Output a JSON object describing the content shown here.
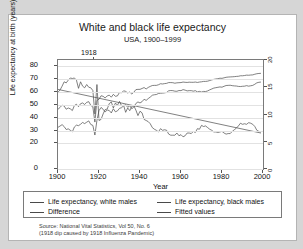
{
  "chart_data": {
    "type": "line",
    "title": "White and black life expectancy",
    "subtitle": "USA, 1900–1999",
    "xlabel": "Year",
    "ylabel": "Life expectancy at birth (years)",
    "xlim": [
      1900,
      2000
    ],
    "ylim": [
      0,
      85
    ],
    "xticks": [
      "1900",
      "1920",
      "1940",
      "1960",
      "1980",
      "2000"
    ],
    "yticks": [
      "0",
      "20",
      "30",
      "40",
      "50",
      "60",
      "70",
      "80"
    ],
    "right_axis_ticks": [
      "0",
      "5",
      "10",
      "15",
      "20"
    ],
    "right_axis_lim": [
      0,
      20
    ],
    "grid": "horizontal",
    "legend_position": "below-plot",
    "annotation": "1918",
    "annotation_x": 1918,
    "series": [
      {
        "name": "Life expectancy, white males",
        "axis": "left",
        "values": [
          [
            1900,
            46.6
          ],
          [
            1901,
            48.0
          ],
          [
            1902,
            49.8
          ],
          [
            1903,
            49.1
          ],
          [
            1904,
            46.6
          ],
          [
            1905,
            47.6
          ],
          [
            1906,
            46.9
          ],
          [
            1907,
            45.6
          ],
          [
            1908,
            49.5
          ],
          [
            1909,
            50.5
          ],
          [
            1910,
            48.6
          ],
          [
            1911,
            50.9
          ],
          [
            1912,
            51.5
          ],
          [
            1913,
            50.3
          ],
          [
            1914,
            52.0
          ],
          [
            1915,
            52.5
          ],
          [
            1916,
            49.6
          ],
          [
            1917,
            48.4
          ],
          [
            1918,
            36.6
          ],
          [
            1919,
            53.5
          ],
          [
            1920,
            54.4
          ],
          [
            1921,
            57.1
          ],
          [
            1922,
            56.7
          ],
          [
            1923,
            55.4
          ],
          [
            1924,
            57.0
          ],
          [
            1925,
            57.6
          ],
          [
            1926,
            56.0
          ],
          [
            1927,
            58.2
          ],
          [
            1928,
            56.7
          ],
          [
            1929,
            57.0
          ],
          [
            1930,
            59.7
          ],
          [
            1931,
            59.4
          ],
          [
            1932,
            61.0
          ],
          [
            1933,
            60.5
          ],
          [
            1934,
            59.3
          ],
          [
            1935,
            60.0
          ],
          [
            1936,
            58.5
          ],
          [
            1937,
            59.9
          ],
          [
            1938,
            61.9
          ],
          [
            1939,
            62.1
          ],
          [
            1940,
            62.1
          ],
          [
            1941,
            62.8
          ],
          [
            1942,
            63.5
          ],
          [
            1943,
            62.4
          ],
          [
            1944,
            63.6
          ],
          [
            1945,
            64.4
          ],
          [
            1946,
            65.1
          ],
          [
            1947,
            65.2
          ],
          [
            1948,
            65.2
          ],
          [
            1949,
            65.7
          ],
          [
            1950,
            66.5
          ],
          [
            1951,
            66.3
          ],
          [
            1952,
            66.6
          ],
          [
            1953,
            66.8
          ],
          [
            1954,
            67.4
          ],
          [
            1955,
            67.4
          ],
          [
            1956,
            67.3
          ],
          [
            1957,
            66.9
          ],
          [
            1958,
            67.2
          ],
          [
            1959,
            67.3
          ],
          [
            1960,
            67.4
          ],
          [
            1961,
            67.8
          ],
          [
            1962,
            67.6
          ],
          [
            1963,
            67.5
          ],
          [
            1964,
            67.7
          ],
          [
            1965,
            67.6
          ],
          [
            1966,
            67.6
          ],
          [
            1967,
            67.8
          ],
          [
            1968,
            67.5
          ],
          [
            1969,
            67.8
          ],
          [
            1970,
            68.0
          ],
          [
            1971,
            68.3
          ],
          [
            1972,
            68.3
          ],
          [
            1973,
            68.5
          ],
          [
            1974,
            69.0
          ],
          [
            1975,
            69.5
          ],
          [
            1976,
            69.9
          ],
          [
            1977,
            70.2
          ],
          [
            1978,
            70.4
          ],
          [
            1979,
            70.8
          ],
          [
            1980,
            70.7
          ],
          [
            1981,
            71.1
          ],
          [
            1982,
            71.5
          ],
          [
            1983,
            71.7
          ],
          [
            1984,
            71.8
          ],
          [
            1985,
            71.9
          ],
          [
            1986,
            72.0
          ],
          [
            1987,
            72.2
          ],
          [
            1988,
            72.3
          ],
          [
            1989,
            72.7
          ],
          [
            1990,
            72.7
          ],
          [
            1991,
            72.9
          ],
          [
            1992,
            73.2
          ],
          [
            1993,
            73.1
          ],
          [
            1994,
            73.3
          ],
          [
            1995,
            73.4
          ],
          [
            1996,
            73.9
          ],
          [
            1997,
            74.3
          ],
          [
            1998,
            74.5
          ],
          [
            1999,
            74.6
          ]
        ]
      },
      {
        "name": "Life expectancy, black males",
        "axis": "left",
        "values": [
          [
            1900,
            32.5
          ],
          [
            1901,
            33.5
          ],
          [
            1902,
            34.6
          ],
          [
            1903,
            33.1
          ],
          [
            1904,
            30.8
          ],
          [
            1905,
            31.3
          ],
          [
            1906,
            30.2
          ],
          [
            1907,
            29.0
          ],
          [
            1908,
            32.8
          ],
          [
            1909,
            34.2
          ],
          [
            1910,
            33.8
          ],
          [
            1911,
            34.9
          ],
          [
            1912,
            36.3
          ],
          [
            1913,
            35.4
          ],
          [
            1914,
            36.5
          ],
          [
            1915,
            37.5
          ],
          [
            1916,
            34.7
          ],
          [
            1917,
            34.0
          ],
          [
            1918,
            26.5
          ],
          [
            1919,
            38.0
          ],
          [
            1920,
            45.5
          ],
          [
            1921,
            48.0
          ],
          [
            1922,
            46.6
          ],
          [
            1923,
            44.5
          ],
          [
            1924,
            46.0
          ],
          [
            1925,
            45.6
          ],
          [
            1926,
            43.7
          ],
          [
            1927,
            47.0
          ],
          [
            1928,
            44.6
          ],
          [
            1929,
            45.3
          ],
          [
            1930,
            47.3
          ],
          [
            1931,
            47.8
          ],
          [
            1932,
            49.3
          ],
          [
            1933,
            50.1
          ],
          [
            1934,
            48.1
          ],
          [
            1935,
            49.3
          ],
          [
            1936,
            47.0
          ],
          [
            1937,
            48.3
          ],
          [
            1938,
            51.1
          ],
          [
            1939,
            52.3
          ],
          [
            1940,
            51.5
          ],
          [
            1941,
            52.5
          ],
          [
            1942,
            54.4
          ],
          [
            1943,
            53.5
          ],
          [
            1944,
            54.9
          ],
          [
            1945,
            56.1
          ],
          [
            1946,
            57.5
          ],
          [
            1947,
            57.9
          ],
          [
            1948,
            58.1
          ],
          [
            1949,
            58.9
          ],
          [
            1950,
            59.1
          ],
          [
            1951,
            59.2
          ],
          [
            1952,
            59.4
          ],
          [
            1953,
            59.7
          ],
          [
            1954,
            61.0
          ],
          [
            1955,
            61.2
          ],
          [
            1956,
            61.1
          ],
          [
            1957,
            60.7
          ],
          [
            1958,
            60.6
          ],
          [
            1959,
            61.2
          ],
          [
            1960,
            61.1
          ],
          [
            1961,
            61.9
          ],
          [
            1962,
            61.5
          ],
          [
            1963,
            60.9
          ],
          [
            1964,
            61.1
          ],
          [
            1965,
            61.1
          ],
          [
            1966,
            60.7
          ],
          [
            1967,
            61.1
          ],
          [
            1968,
            60.1
          ],
          [
            1969,
            60.5
          ],
          [
            1970,
            60.0
          ],
          [
            1971,
            60.5
          ],
          [
            1972,
            60.4
          ],
          [
            1973,
            60.9
          ],
          [
            1974,
            61.7
          ],
          [
            1975,
            62.4
          ],
          [
            1976,
            63.1
          ],
          [
            1977,
            63.4
          ],
          [
            1978,
            63.7
          ],
          [
            1979,
            64.0
          ],
          [
            1980,
            63.8
          ],
          [
            1981,
            64.5
          ],
          [
            1982,
            65.1
          ],
          [
            1983,
            65.2
          ],
          [
            1984,
            65.3
          ],
          [
            1985,
            65.0
          ],
          [
            1986,
            64.8
          ],
          [
            1987,
            64.7
          ],
          [
            1988,
            64.4
          ],
          [
            1989,
            64.3
          ],
          [
            1990,
            64.5
          ],
          [
            1991,
            64.6
          ],
          [
            1992,
            65.0
          ],
          [
            1993,
            64.6
          ],
          [
            1994,
            64.9
          ],
          [
            1995,
            65.2
          ],
          [
            1996,
            66.1
          ],
          [
            1997,
            67.2
          ],
          [
            1998,
            67.6
          ],
          [
            1999,
            67.8
          ]
        ]
      },
      {
        "name": "Difference",
        "axis": "right",
        "values": [
          [
            1900,
            14.1
          ],
          [
            1901,
            14.5
          ],
          [
            1902,
            15.2
          ],
          [
            1903,
            16.0
          ],
          [
            1904,
            15.8
          ],
          [
            1905,
            16.3
          ],
          [
            1906,
            16.7
          ],
          [
            1907,
            16.6
          ],
          [
            1908,
            16.7
          ],
          [
            1909,
            16.3
          ],
          [
            1910,
            14.8
          ],
          [
            1911,
            16.0
          ],
          [
            1912,
            15.2
          ],
          [
            1913,
            14.9
          ],
          [
            1914,
            15.5
          ],
          [
            1915,
            15.0
          ],
          [
            1916,
            14.9
          ],
          [
            1917,
            14.4
          ],
          [
            1918,
            10.1
          ],
          [
            1919,
            15.5
          ],
          [
            1920,
            8.9
          ],
          [
            1921,
            9.1
          ],
          [
            1922,
            10.1
          ],
          [
            1923,
            10.9
          ],
          [
            1924,
            11.0
          ],
          [
            1925,
            12.0
          ],
          [
            1926,
            12.3
          ],
          [
            1927,
            11.2
          ],
          [
            1928,
            12.1
          ],
          [
            1929,
            11.7
          ],
          [
            1930,
            12.4
          ],
          [
            1931,
            11.6
          ],
          [
            1932,
            11.7
          ],
          [
            1933,
            10.4
          ],
          [
            1934,
            11.2
          ],
          [
            1935,
            10.7
          ],
          [
            1936,
            11.5
          ],
          [
            1937,
            11.6
          ],
          [
            1938,
            10.8
          ],
          [
            1939,
            9.8
          ],
          [
            1940,
            10.6
          ],
          [
            1941,
            10.3
          ],
          [
            1942,
            9.1
          ],
          [
            1943,
            8.9
          ],
          [
            1944,
            8.7
          ],
          [
            1945,
            8.3
          ],
          [
            1946,
            7.6
          ],
          [
            1947,
            7.3
          ],
          [
            1948,
            7.1
          ],
          [
            1949,
            6.8
          ],
          [
            1950,
            7.4
          ],
          [
            1951,
            7.1
          ],
          [
            1952,
            7.2
          ],
          [
            1953,
            7.1
          ],
          [
            1954,
            6.4
          ],
          [
            1955,
            6.2
          ],
          [
            1956,
            6.2
          ],
          [
            1957,
            6.2
          ],
          [
            1958,
            6.6
          ],
          [
            1959,
            6.1
          ],
          [
            1960,
            6.3
          ],
          [
            1961,
            5.9
          ],
          [
            1962,
            6.1
          ],
          [
            1963,
            6.6
          ],
          [
            1964,
            6.6
          ],
          [
            1965,
            6.5
          ],
          [
            1966,
            6.9
          ],
          [
            1967,
            6.7
          ],
          [
            1968,
            7.4
          ],
          [
            1969,
            7.3
          ],
          [
            1970,
            8.0
          ],
          [
            1971,
            7.8
          ],
          [
            1972,
            7.9
          ],
          [
            1973,
            7.6
          ],
          [
            1974,
            7.3
          ],
          [
            1975,
            7.1
          ],
          [
            1976,
            6.8
          ],
          [
            1977,
            6.8
          ],
          [
            1978,
            6.7
          ],
          [
            1979,
            6.8
          ],
          [
            1980,
            6.9
          ],
          [
            1981,
            6.6
          ],
          [
            1982,
            6.4
          ],
          [
            1983,
            6.5
          ],
          [
            1984,
            6.5
          ],
          [
            1985,
            6.9
          ],
          [
            1986,
            7.2
          ],
          [
            1987,
            7.5
          ],
          [
            1988,
            7.9
          ],
          [
            1989,
            8.4
          ],
          [
            1990,
            8.2
          ],
          [
            1991,
            8.3
          ],
          [
            1992,
            8.2
          ],
          [
            1993,
            8.5
          ],
          [
            1994,
            8.4
          ],
          [
            1995,
            8.2
          ],
          [
            1996,
            7.8
          ],
          [
            1997,
            7.1
          ],
          [
            1998,
            6.9
          ],
          [
            1999,
            6.8
          ]
        ]
      },
      {
        "name": "Fitted values",
        "axis": "right",
        "values": [
          [
            1900,
            14.6
          ],
          [
            1999,
            6.6
          ]
        ]
      }
    ]
  },
  "legend": {
    "items": [
      "Life expectancy, white males",
      "Life expectancy, black males",
      "Difference",
      "Fitted values"
    ]
  },
  "source": {
    "line1": "Source: National Vital Statistics, Vol 50, No. 6",
    "line2": "(1918 dip caused by 1918 Influenza Pandemic)"
  },
  "colors": {
    "line": "#4a4a4a",
    "frame": "#7a7a7a",
    "grid": "#e2e2e2",
    "page_background": "#d6d6d6",
    "panel_background": "#ffffff"
  }
}
